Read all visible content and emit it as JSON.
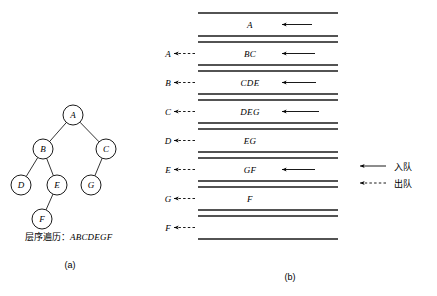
{
  "figure": {
    "panel_a": {
      "caption": "(a)",
      "traversal_label": "层序遍历：",
      "traversal_sequence": "ABCDEGF",
      "nodes": [
        {
          "id": "A",
          "label": "A",
          "cx": 73,
          "cy": 115,
          "r": 10
        },
        {
          "id": "B",
          "label": "B",
          "cx": 43,
          "cy": 149,
          "r": 10
        },
        {
          "id": "C",
          "label": "C",
          "cx": 106,
          "cy": 149,
          "r": 10
        },
        {
          "id": "D",
          "label": "D",
          "cx": 21,
          "cy": 185,
          "r": 10
        },
        {
          "id": "E",
          "label": "E",
          "cx": 57,
          "cy": 185,
          "r": 10
        },
        {
          "id": "G",
          "label": "G",
          "cx": 91,
          "cy": 185,
          "r": 10
        },
        {
          "id": "F",
          "label": "F",
          "cx": 42,
          "cy": 219,
          "r": 10
        }
      ],
      "edges": [
        {
          "from": "A",
          "to": "B"
        },
        {
          "from": "A",
          "to": "C"
        },
        {
          "from": "B",
          "to": "D"
        },
        {
          "from": "B",
          "to": "E"
        },
        {
          "from": "C",
          "to": "G"
        },
        {
          "from": "E",
          "to": "F"
        }
      ]
    },
    "panel_b": {
      "caption": "(b)",
      "rail_left": 38,
      "rail_right": 178,
      "rows": [
        {
          "dequeued": "",
          "content": "A",
          "enqueue_arrow": true,
          "enqueue_len": 30,
          "top": 13,
          "bottom": 36
        },
        {
          "dequeued": "A",
          "content": "BC",
          "enqueue_arrow": true,
          "enqueue_len": 33,
          "top": 42,
          "bottom": 65
        },
        {
          "dequeued": "B",
          "content": "CDE",
          "enqueue_arrow": true,
          "enqueue_len": 34,
          "top": 71,
          "bottom": 94
        },
        {
          "dequeued": "C",
          "content": "DEG",
          "enqueue_arrow": true,
          "enqueue_len": 37,
          "top": 100,
          "bottom": 123
        },
        {
          "dequeued": "D",
          "content": "EG",
          "enqueue_arrow": false,
          "enqueue_len": 0,
          "top": 129,
          "bottom": 152
        },
        {
          "dequeued": "E",
          "content": "GF",
          "enqueue_arrow": true,
          "enqueue_len": 33,
          "top": 158,
          "bottom": 181
        },
        {
          "dequeued": "G",
          "content": "F",
          "enqueue_arrow": false,
          "enqueue_len": 0,
          "top": 187,
          "bottom": 210
        },
        {
          "dequeued": "F",
          "content": "",
          "enqueue_arrow": false,
          "enqueue_len": 0,
          "top": 216,
          "bottom": 239
        }
      ],
      "legend": [
        {
          "kind": "solid",
          "text": "入队"
        },
        {
          "kind": "dashed",
          "text": "出队"
        }
      ]
    }
  },
  "colors": {
    "ink": "#000000",
    "rail": "#1a1a1a",
    "background": "#ffffff"
  }
}
